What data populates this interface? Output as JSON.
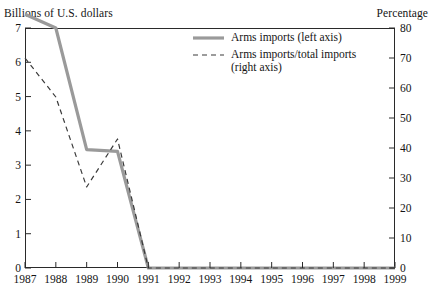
{
  "captions": {
    "left_axis_title": "Billions of U.S. dollars",
    "right_axis_title": "Percentage"
  },
  "legend": {
    "items": [
      {
        "label": "Arms imports (left axis)",
        "style": "solid",
        "icon": "solid-line-icon",
        "color": "#9a9a9a"
      },
      {
        "label": "Arms imports/total imports\n(right axis)",
        "label_line1": "Arms imports/total imports",
        "label_line2": "(right axis)",
        "style": "dashed",
        "icon": "dashed-line-icon",
        "color": "#3a3a3a"
      }
    ]
  },
  "chart_data": {
    "type": "line",
    "title": "",
    "subtitle": "",
    "xlabel": "",
    "ylabel": "Billions of U.S. dollars",
    "y2label": "Percentage",
    "grid": false,
    "legend_position": "top-center",
    "x": [
      "1987",
      "1988",
      "1989",
      "1990",
      "1991",
      "1992",
      "1993",
      "1994",
      "1995",
      "1996",
      "1997",
      "1998",
      "1999"
    ],
    "xlim": [
      1987,
      1999
    ],
    "ylim": [
      0,
      7
    ],
    "y2lim": [
      0,
      80
    ],
    "yticks": [
      0,
      1,
      2,
      3,
      4,
      5,
      6,
      7
    ],
    "ytick_labels": [
      "0",
      "1",
      "2",
      "3",
      "4",
      "5",
      "6",
      "7"
    ],
    "y2ticks": [
      0,
      10,
      20,
      30,
      40,
      50,
      60,
      70,
      80
    ],
    "y2tick_labels": [
      "0",
      "10",
      "20",
      "30",
      "40",
      "50",
      "60",
      "70",
      "80"
    ],
    "xtick_labels": [
      "1987",
      "1988",
      "1989",
      "1990",
      "1991",
      "1992",
      "1993",
      "1994",
      "1995",
      "1996",
      "1997",
      "1998",
      "1999"
    ],
    "series": [
      {
        "name": "Arms imports (left axis)",
        "axis": "left",
        "style": "solid",
        "color": "#9a9a9a",
        "width": 3.2,
        "values": [
          7.4,
          7.0,
          3.45,
          3.4,
          0.0,
          0.0,
          0.0,
          0.0,
          0.0,
          0.0,
          0.0,
          0.0,
          0.0
        ]
      },
      {
        "name": "Arms imports/total imports (right axis)",
        "axis": "right",
        "style": "dashed",
        "color": "#3a3a3a",
        "width": 1.2,
        "values": [
          70,
          57,
          27,
          43,
          0,
          0,
          0,
          0,
          0,
          0,
          0,
          0,
          0
        ]
      }
    ]
  }
}
